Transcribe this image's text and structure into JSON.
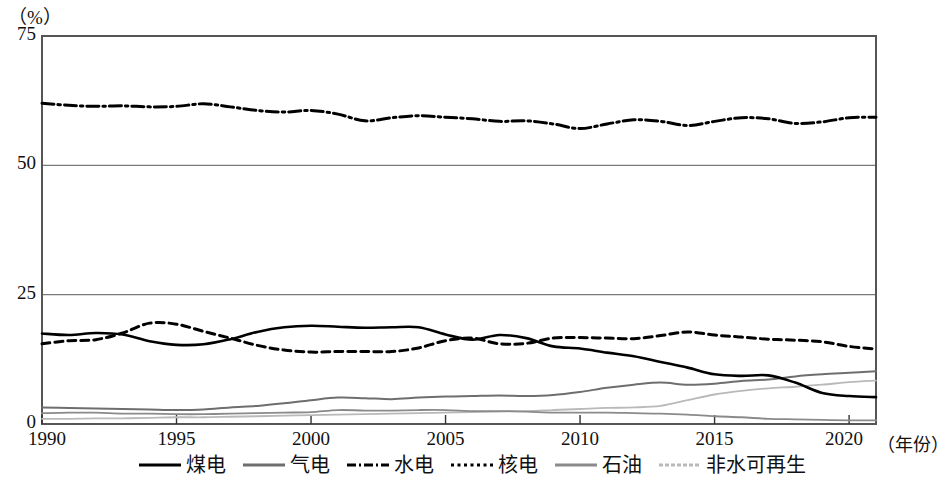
{
  "chart_data": {
    "type": "line",
    "title": "",
    "unit_label": "（%）",
    "xlabel": "（年份）",
    "ylabel": "",
    "xlim": [
      1990,
      2021
    ],
    "ylim": [
      0,
      75
    ],
    "xticks": [
      1990,
      1995,
      2000,
      2005,
      2010,
      2015,
      2020
    ],
    "xtick_labels": [
      "1990",
      "1995",
      "2000",
      "2005",
      "2010",
      "2015",
      "2020"
    ],
    "yticks": [
      0,
      25,
      50,
      75
    ],
    "ytick_labels": [
      "0",
      "25",
      "50",
      "75"
    ],
    "grid": "horizontal",
    "legend_position": "bottom",
    "x": [
      1990,
      1991,
      1992,
      1993,
      1994,
      1995,
      1996,
      1997,
      1998,
      1999,
      2000,
      2001,
      2002,
      2003,
      2004,
      2005,
      2006,
      2007,
      2008,
      2009,
      2010,
      2011,
      2012,
      2013,
      2014,
      2015,
      2016,
      2017,
      2018,
      2019,
      2020,
      2021
    ],
    "series": [
      {
        "name": "煤电",
        "key": "coal",
        "style": "solid",
        "color": "#000000",
        "width": 2.6,
        "values": [
          17.5,
          17.2,
          17.6,
          17.3,
          16.0,
          15.3,
          15.4,
          16.4,
          17.8,
          18.7,
          19.0,
          18.8,
          18.6,
          18.7,
          18.7,
          17.3,
          16.3,
          17.2,
          16.6,
          15.0,
          14.6,
          13.8,
          13.1,
          12.0,
          10.9,
          9.6,
          9.3,
          9.4,
          8.0,
          6.0,
          5.4,
          5.2
        ]
      },
      {
        "name": "气电",
        "key": "gas",
        "style": "solid",
        "color": "#6e6e6e",
        "width": 2.0,
        "values": [
          3.2,
          3.1,
          3.0,
          2.9,
          2.8,
          2.7,
          2.8,
          3.2,
          3.5,
          4.0,
          4.6,
          5.1,
          5.0,
          4.8,
          5.1,
          5.3,
          5.4,
          5.5,
          5.4,
          5.6,
          6.2,
          7.0,
          7.6,
          8.0,
          7.6,
          7.8,
          8.3,
          8.6,
          9.2,
          9.6,
          9.9,
          10.2
        ]
      },
      {
        "name": "水电",
        "key": "hydro",
        "style": "dashdot",
        "color": "#000000",
        "width": 3.0,
        "values": [
          62.0,
          61.6,
          61.4,
          61.5,
          61.3,
          61.4,
          61.9,
          61.3,
          60.6,
          60.3,
          60.6,
          59.9,
          58.6,
          59.2,
          59.6,
          59.3,
          59.0,
          58.5,
          58.6,
          58.0,
          57.1,
          58.0,
          58.8,
          58.5,
          57.7,
          58.5,
          59.2,
          59.0,
          58.1,
          58.4,
          59.2,
          59.3
        ]
      },
      {
        "name": "核电",
        "key": "nuclear",
        "style": "dashed",
        "color": "#000000",
        "width": 3.0,
        "values": [
          15.5,
          16.1,
          16.3,
          17.6,
          19.5,
          19.3,
          17.9,
          16.6,
          15.2,
          14.3,
          13.9,
          14.0,
          14.0,
          14.0,
          14.7,
          16.1,
          16.6,
          15.5,
          15.6,
          16.6,
          16.7,
          16.6,
          16.5,
          17.1,
          17.8,
          17.2,
          16.8,
          16.4,
          16.2,
          15.9,
          15.0,
          14.5
        ]
      },
      {
        "name": "石油",
        "key": "oil",
        "style": "solid",
        "color": "#8a8a8a",
        "width": 1.8,
        "values": [
          2.1,
          2.2,
          2.2,
          2.0,
          2.0,
          1.9,
          1.9,
          2.0,
          2.1,
          2.2,
          2.3,
          2.7,
          2.6,
          2.6,
          2.7,
          2.7,
          2.5,
          2.5,
          2.4,
          2.2,
          2.2,
          2.2,
          2.1,
          2.0,
          1.8,
          1.5,
          1.3,
          1.0,
          0.9,
          0.8,
          0.7,
          0.7
        ]
      },
      {
        "name": "非水可再生",
        "key": "nonhydro_renewable",
        "style": "solid",
        "color": "#b9b9b9",
        "width": 1.8,
        "values": [
          1.0,
          1.0,
          1.1,
          1.1,
          1.2,
          1.3,
          1.3,
          1.4,
          1.5,
          1.6,
          1.7,
          1.8,
          1.9,
          2.0,
          2.1,
          2.2,
          2.3,
          2.4,
          2.5,
          2.7,
          2.9,
          3.1,
          3.2,
          3.5,
          4.6,
          5.7,
          6.4,
          6.9,
          7.2,
          7.6,
          8.1,
          8.4
        ]
      }
    ]
  },
  "legend": {
    "items": [
      {
        "label": "煤电",
        "style": "solid-thick",
        "color": "#000000"
      },
      {
        "label": "气电",
        "style": "solid-gray",
        "color": "#6e6e6e"
      },
      {
        "label": "水电",
        "style": "dashdot",
        "color": "#000000"
      },
      {
        "label": "核电",
        "style": "dotted",
        "color": "#000000"
      },
      {
        "label": "石油",
        "style": "solid-lightgray",
        "color": "#8a8a8a"
      },
      {
        "label": "非水可再生",
        "style": "solid-palegray",
        "color": "#b9b9b9"
      }
    ]
  },
  "axes": {
    "unit": "（%）",
    "x_title": "（年份）",
    "frame_color": "#555555",
    "grid_color": "#7a7a7a"
  }
}
